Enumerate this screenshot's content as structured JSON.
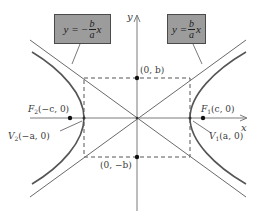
{
  "diagram": {
    "type": "hyperbola",
    "axes": {
      "x_label": "x",
      "y_label": "y"
    },
    "asymptotes": [
      {
        "id": "positive",
        "lhs": "y =",
        "sign": "",
        "numerator": "b",
        "denominator": "a",
        "var": "x"
      },
      {
        "id": "negative",
        "lhs": "y =",
        "sign": "−",
        "numerator": "b",
        "denominator": "a",
        "var": "x"
      }
    ],
    "points": {
      "b_top": "(0, b)",
      "b_bottom": "(0, −b)",
      "focus_right": {
        "name": "F",
        "sub": "1",
        "coords": "(c, 0)"
      },
      "focus_left": {
        "name": "F",
        "sub": "2",
        "coords": "(−c, 0)"
      },
      "vertex_right": {
        "name": "V",
        "sub": "1",
        "coords": "(a, 0)"
      },
      "vertex_left": {
        "name": "V",
        "sub": "2",
        "coords": "(−a, 0)"
      }
    },
    "colors": {
      "curve": "#555555",
      "axis": "#777777",
      "box_fill": "#9c9c9c",
      "box_border": "#4a4a4a",
      "dot": "#111111"
    }
  }
}
